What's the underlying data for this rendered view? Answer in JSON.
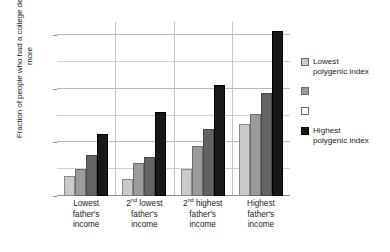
{
  "chart_data": {
    "type": "bar",
    "title": "",
    "xlabel": "",
    "ylabel": "Fraction of people who had a college degree or more",
    "ylim": [
      0.0,
      0.65
    ],
    "yticks": [
      "0.0",
      "0.2",
      "0.4",
      "0.6"
    ],
    "ytick_values": [
      0.0,
      0.2,
      0.4,
      0.6
    ],
    "minor_gridlines": [
      0.1,
      0.3,
      0.5
    ],
    "grid": true,
    "legend_position": "right",
    "categories": [
      "Lowest father's income",
      "2nd lowest father's income",
      "2nd highest father's income",
      "Highest father's income"
    ],
    "category_lines": [
      [
        "Lowest",
        "father's",
        "income"
      ],
      [
        "2nd lowest",
        "father's",
        "income"
      ],
      [
        "2nd highest",
        "father's",
        "income"
      ],
      [
        "Highest",
        "father's",
        "income"
      ]
    ],
    "series": [
      {
        "name": "Lowest polygenic index",
        "color": "#c9c9c9",
        "values": [
          0.075,
          0.065,
          0.1,
          0.27
        ]
      },
      {
        "name": "",
        "color": "#9b9b9b",
        "values": [
          0.1,
          0.125,
          0.185,
          0.305
        ]
      },
      {
        "name": "",
        "color": "#636363",
        "values": [
          0.155,
          0.145,
          0.25,
          0.385
        ]
      },
      {
        "name": "Highest polygenic index",
        "color": "#181818",
        "values": [
          0.23,
          0.315,
          0.415,
          0.615
        ]
      }
    ]
  },
  "legend": {
    "entries": [
      {
        "label_line1": "Lowest",
        "label_line2": "polygenic index",
        "swatch": "light-gray"
      },
      {
        "label_line1": "",
        "label_line2": "",
        "swatch": "medium-gray"
      },
      {
        "label_line1": "",
        "label_line2": "",
        "swatch": "white"
      },
      {
        "label_line1": "Highest",
        "label_line2": "polygenic index",
        "swatch": "black"
      }
    ]
  },
  "axis": {
    "y_title": "Fraction of people who had a college degree or more"
  }
}
